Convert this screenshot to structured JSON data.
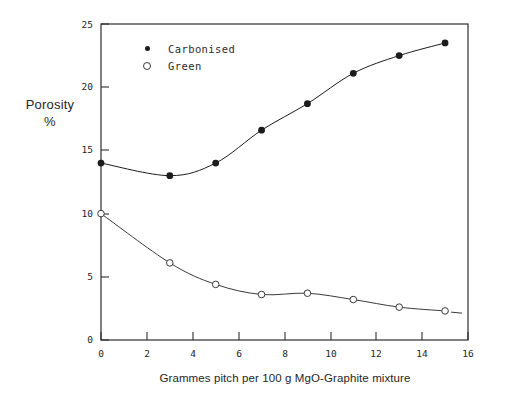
{
  "chart_data": {
    "type": "line",
    "title": "",
    "xlabel": "Grammes pitch per 100 g MgO-Graphite mixture",
    "ylabel": "Porosity",
    "ylabel_line2": "%",
    "xlim": [
      0,
      16
    ],
    "ylim": [
      0,
      25
    ],
    "xticks": [
      0,
      2,
      4,
      6,
      8,
      10,
      12,
      14,
      16
    ],
    "xtick_labels": [
      "0",
      "2",
      "4",
      "6",
      "8",
      "10",
      "12",
      "14",
      "16"
    ],
    "yticks": [
      0,
      5,
      10,
      15,
      20,
      25
    ],
    "ytick_labels": [
      "0",
      "5",
      "10",
      "15",
      "20",
      "25"
    ],
    "grid": false,
    "legend_position": "upper-left-inside",
    "series": [
      {
        "name": "Carbonised",
        "marker": "filled-circle",
        "color": "#1c1c1c",
        "x": [
          0,
          3,
          5,
          7,
          9,
          11,
          13,
          15
        ],
        "values": [
          14.0,
          13.0,
          14.0,
          16.6,
          18.7,
          21.1,
          22.5,
          23.5
        ]
      },
      {
        "name": "Green",
        "marker": "open-circle",
        "color": "#3a3a3a",
        "x": [
          0,
          3,
          5,
          7,
          9,
          11,
          13,
          15
        ],
        "values": [
          10.0,
          6.1,
          4.4,
          3.6,
          3.7,
          3.2,
          2.6,
          2.3
        ]
      }
    ]
  },
  "legend": {
    "items": [
      {
        "label": "Carbonised",
        "marker": "filled-circle"
      },
      {
        "label": "Green",
        "marker": "open-circle"
      }
    ]
  },
  "axes": {
    "y_title_line1": "Porosity",
    "y_title_line2": "%",
    "x_title": "Grammes pitch per 100 g MgO-Graphite mixture"
  },
  "colors": {
    "axis": "#2e2e2e",
    "carbonised": "#1c1c1c",
    "green": "#3a3a3a",
    "background": "#ffffff"
  }
}
